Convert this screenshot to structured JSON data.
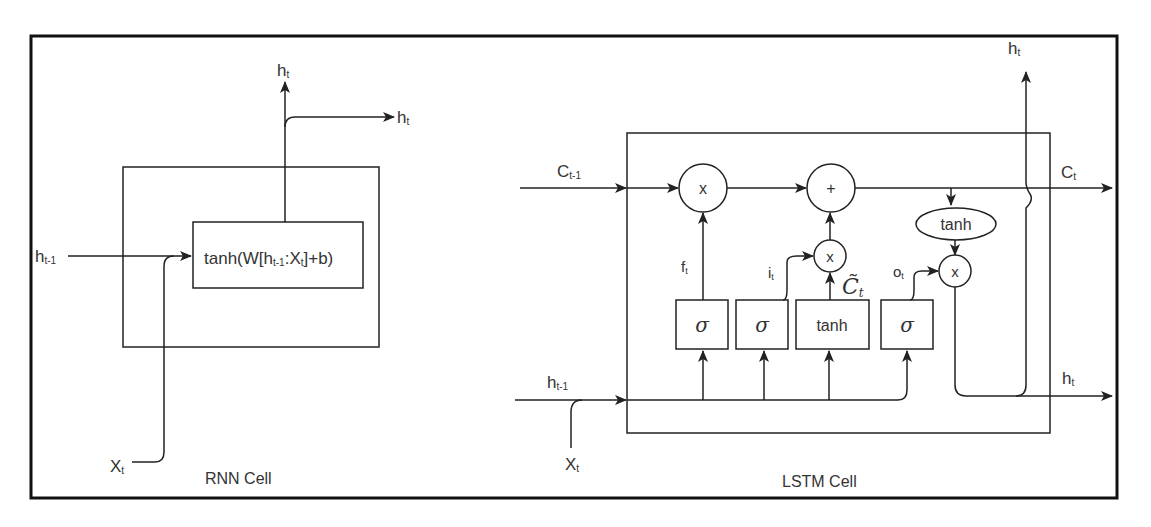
{
  "figure": {
    "rnn": {
      "caption": "RNN Cell",
      "core_fn": "tanh(W[h",
      "core_fn_sub": "t-1",
      "core_fn_mid": ":X",
      "core_fn_sub2": "t",
      "core_fn_end": "]+b)",
      "input_h": "h",
      "input_h_sub": "t-1",
      "input_x": "X",
      "input_x_sub": "t",
      "output_up": "h",
      "output_up_sub": "t",
      "output_right": "h",
      "output_right_sub": "t"
    },
    "lstm": {
      "caption": "LSTM Cell",
      "c_prev": "C",
      "c_prev_sub": "t-1",
      "c_next": "C",
      "c_next_sub": "t",
      "h_prev": "h",
      "h_prev_sub": "t-1",
      "x_in": "X",
      "x_in_sub": "t",
      "h_up": "h",
      "h_up_sub": "t",
      "h_right": "h",
      "h_right_sub": "t",
      "forget_label": "f",
      "forget_sub": "t",
      "input_label": "i",
      "input_sub": "t",
      "output_label": "o",
      "output_sub": "t",
      "candidate_label": "C̃",
      "candidate_sub": "t",
      "ops": {
        "mult": "x",
        "add": "+"
      },
      "gates": [
        {
          "name": "forget",
          "fn": "σ"
        },
        {
          "name": "input",
          "fn": "σ"
        },
        {
          "name": "candidate",
          "fn": "tanh"
        },
        {
          "name": "output",
          "fn": "σ"
        }
      ],
      "cell_tanh": "tanh"
    }
  }
}
